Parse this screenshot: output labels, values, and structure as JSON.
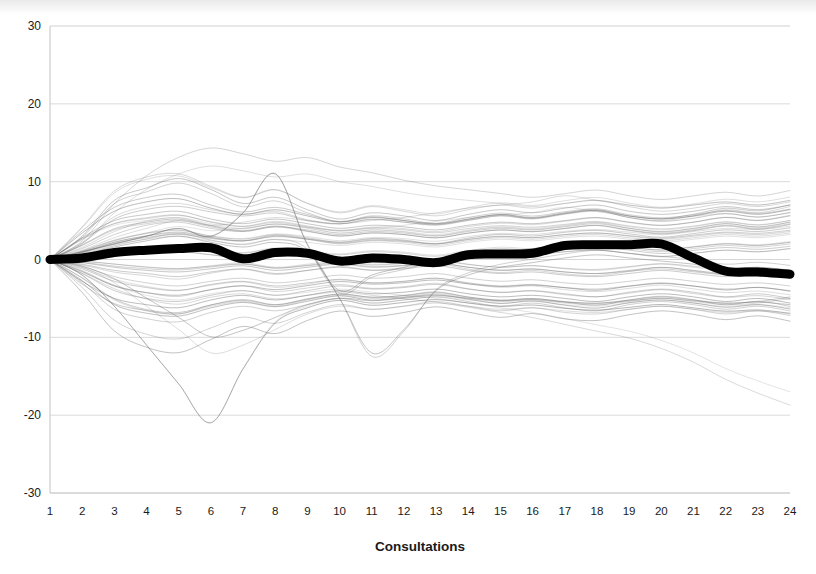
{
  "chart_data": {
    "type": "line",
    "title": "",
    "subtitle": "",
    "xlabel": "Consultations",
    "ylabel": "",
    "xlim": [
      1,
      24
    ],
    "ylim": [
      -30,
      30
    ],
    "grid": true,
    "grid_axis": "y",
    "legend": "none",
    "x": [
      1,
      2,
      3,
      4,
      5,
      6,
      7,
      8,
      9,
      10,
      11,
      12,
      13,
      14,
      15,
      16,
      17,
      18,
      19,
      20,
      21,
      22,
      23,
      24
    ],
    "y_ticks": [
      30,
      20,
      10,
      0,
      -10,
      -20,
      -30
    ],
    "y_tick_labels": [
      "30",
      "20",
      "10",
      "0",
      "-10",
      "-20",
      "-30"
    ],
    "x_tick_labels": [
      "1",
      "2",
      "3",
      "4",
      "5",
      "6",
      "7",
      "8",
      "9",
      "10",
      "11",
      "12",
      "13",
      "14",
      "15",
      "16",
      "17",
      "18",
      "19",
      "20",
      "21",
      "22",
      "23",
      "24"
    ],
    "annotations": [],
    "series": [
      {
        "name": "Mean",
        "role": "mean",
        "emphasis": "thick-black",
        "color": "#000000",
        "width": 9,
        "values": [
          0.0,
          0.2,
          0.9,
          1.2,
          1.4,
          1.5,
          0.1,
          0.9,
          0.8,
          -0.2,
          0.2,
          0.0,
          -0.4,
          0.6,
          0.7,
          0.8,
          1.8,
          1.9,
          1.9,
          2.0,
          0.2,
          -1.5,
          -1.6,
          -1.9
        ]
      },
      {
        "name": "individual-patients",
        "role": "spaghetti",
        "emphasis": "thin-gray",
        "color": "#6b6b6b",
        "width": 0.55,
        "count": 60,
        "series": [
          {
            "name": "p1",
            "values": [
              0,
              2.2,
              5.5,
              6.8,
              7.2,
              6.4,
              5.8,
              6.2,
              5.1,
              4.6,
              5.2,
              4.8,
              4.4,
              5.0,
              5.6,
              5.2,
              5.8,
              6.2,
              5.4,
              5.0,
              5.6,
              6.4,
              6.0,
              6.8
            ]
          },
          {
            "name": "p2",
            "values": [
              0,
              1.4,
              3.2,
              4.4,
              4.8,
              4.0,
              3.6,
              4.2,
              3.8,
              3.2,
              3.6,
              3.4,
              3.0,
              3.6,
              4.0,
              3.8,
              4.2,
              4.6,
              4.0,
              3.6,
              4.0,
              4.6,
              4.2,
              4.8
            ]
          },
          {
            "name": "p3",
            "values": [
              0,
              3.0,
              7.6,
              9.2,
              10.4,
              9.0,
              7.2,
              8.0,
              6.4,
              5.2,
              6.0,
              5.6,
              5.0,
              5.8,
              6.4,
              6.0,
              6.6,
              7.0,
              6.2,
              5.8,
              6.2,
              6.8,
              6.4,
              7.0
            ]
          },
          {
            "name": "p4",
            "values": [
              0,
              0.8,
              1.9,
              2.6,
              3.0,
              2.4,
              2.0,
              2.6,
              2.2,
              1.8,
              2.2,
              2.0,
              1.6,
              2.2,
              2.6,
              2.4,
              2.8,
              3.0,
              2.6,
              2.2,
              2.6,
              3.0,
              2.8,
              3.2
            ]
          },
          {
            "name": "p5",
            "values": [
              0,
              4.2,
              8.8,
              10.6,
              11.0,
              9.4,
              8.0,
              9.0,
              7.2,
              6.0,
              6.8,
              6.2,
              5.6,
              6.4,
              7.0,
              6.6,
              7.2,
              7.6,
              6.8,
              6.2,
              6.6,
              7.2,
              6.8,
              7.4
            ]
          },
          {
            "name": "p6",
            "values": [
              0,
              -1.2,
              -2.8,
              -3.6,
              -4.0,
              -3.2,
              -2.8,
              -3.4,
              -3.0,
              -2.6,
              -3.0,
              -2.8,
              -2.4,
              -3.0,
              -3.4,
              -3.2,
              -3.6,
              -3.8,
              -3.4,
              -3.0,
              -3.4,
              -3.8,
              -3.6,
              -4.0
            ]
          },
          {
            "name": "p7",
            "values": [
              0,
              -2.4,
              -5.2,
              -6.6,
              -7.0,
              -6.0,
              -5.4,
              -6.0,
              -5.2,
              -4.6,
              -5.0,
              -4.8,
              -4.4,
              -5.0,
              -5.4,
              -5.2,
              -5.6,
              -5.8,
              -5.4,
              -5.0,
              -5.4,
              -5.8,
              -5.6,
              -5.0
            ]
          },
          {
            "name": "p8",
            "values": [
              0,
              -3.6,
              -7.8,
              -9.6,
              -10.2,
              -8.8,
              -7.4,
              -8.2,
              -6.8,
              -5.8,
              -6.4,
              -6.0,
              -5.4,
              -6.0,
              -6.6,
              -6.2,
              -6.8,
              -7.0,
              -6.4,
              -6.0,
              -6.4,
              -7.0,
              -6.6,
              -7.2
            ]
          },
          {
            "name": "p9-outlier-low",
            "values": [
              0,
              -2.0,
              -6.0,
              -11.0,
              -16.0,
              -21.0,
              -14.0,
              -8.0,
              -6.0,
              -5.0,
              -5.6,
              -5.2,
              -4.8,
              -5.2,
              -5.6,
              -5.4,
              -5.8,
              -6.0,
              -5.6,
              -5.2,
              -5.6,
              -6.0,
              -5.8,
              -6.2
            ]
          },
          {
            "name": "p10-outlier-high",
            "values": [
              0,
              2.0,
              6.0,
              9.0,
              11.0,
              12.0,
              11.4,
              10.6,
              11.0,
              10.0,
              9.4,
              8.6,
              8.0,
              7.6,
              7.2,
              6.8,
              7.2,
              7.6,
              7.0,
              6.6,
              7.0,
              7.4,
              7.0,
              7.6
            ]
          },
          {
            "name": "p11",
            "values": [
              0,
              0.4,
              1.0,
              1.4,
              1.8,
              1.2,
              0.8,
              1.4,
              1.0,
              0.6,
              1.0,
              0.8,
              0.4,
              1.0,
              1.4,
              1.2,
              1.6,
              1.8,
              1.4,
              1.0,
              1.4,
              1.8,
              1.6,
              2.0
            ]
          },
          {
            "name": "p12",
            "values": [
              0,
              -0.6,
              -1.4,
              -1.8,
              -2.2,
              -1.6,
              -1.2,
              -1.8,
              -1.4,
              -1.0,
              -1.4,
              -1.2,
              -0.8,
              -1.4,
              -1.8,
              -1.6,
              -2.0,
              -2.2,
              -1.8,
              -1.4,
              -1.8,
              -2.2,
              -2.0,
              -2.4
            ]
          },
          {
            "name": "p13-spike8",
            "values": [
              0,
              1.0,
              2.0,
              3.0,
              4.0,
              3.0,
              6.0,
              11.0,
              2.0,
              -4.0,
              -2.0,
              -1.0,
              0.0,
              0.5,
              1.0,
              1.4,
              1.8,
              2.0,
              1.6,
              1.2,
              1.6,
              2.0,
              1.8,
              2.2
            ]
          },
          {
            "name": "p14-spike6",
            "values": [
              0,
              -1.0,
              -3.0,
              -6.0,
              -9.0,
              -12.0,
              -11.0,
              -9.0,
              -7.0,
              -6.0,
              -6.4,
              -6.0,
              -5.6,
              -6.0,
              -6.4,
              -6.2,
              -6.6,
              -6.8,
              -6.4,
              -6.0,
              -6.4,
              -6.8,
              -6.6,
              -7.0
            ]
          },
          {
            "name": "p15",
            "values": [
              0,
              2.6,
              4.4,
              5.0,
              5.4,
              4.6,
              4.0,
              4.6,
              4.0,
              3.4,
              3.8,
              3.6,
              3.2,
              3.8,
              4.2,
              4.0,
              4.4,
              4.8,
              4.2,
              3.8,
              4.2,
              4.8,
              4.4,
              5.0
            ]
          },
          {
            "name": "p16",
            "values": [
              0,
              -0.2,
              -0.6,
              -1.0,
              -1.2,
              -0.8,
              -0.4,
              -1.0,
              -0.6,
              -0.2,
              -0.6,
              -0.4,
              0.0,
              -0.6,
              -1.0,
              -0.8,
              -1.2,
              -1.4,
              -1.0,
              -0.6,
              -1.0,
              -1.4,
              -1.2,
              -1.6
            ]
          },
          {
            "name": "p17",
            "values": [
              0,
              1.8,
              3.8,
              4.6,
              5.0,
              4.2,
              3.6,
              4.2,
              3.6,
              3.0,
              3.4,
              3.2,
              2.8,
              3.4,
              3.8,
              3.6,
              4.0,
              4.4,
              3.8,
              3.4,
              3.8,
              4.4,
              4.0,
              4.6
            ]
          },
          {
            "name": "p18",
            "values": [
              0,
              -1.8,
              -4.0,
              -5.0,
              -5.4,
              -4.6,
              -4.0,
              -4.6,
              -4.0,
              -3.4,
              -3.8,
              -3.6,
              -3.2,
              -3.8,
              -4.2,
              -4.0,
              -4.4,
              -4.8,
              -4.2,
              -3.8,
              -4.2,
              -4.8,
              -4.4,
              -5.0
            ]
          },
          {
            "name": "p19-drop11",
            "values": [
              0,
              0.6,
              1.6,
              2.4,
              3.0,
              2.2,
              1.6,
              2.2,
              1.0,
              -5.0,
              -12.0,
              -9.0,
              -4.0,
              -2.0,
              -1.0,
              -0.4,
              0.2,
              0.6,
              0.2,
              -0.2,
              -0.6,
              -1.2,
              -1.0,
              -1.4
            ]
          },
          {
            "name": "p20-high17",
            "values": [
              0,
              1.2,
              2.8,
              4.0,
              5.0,
              4.4,
              4.8,
              5.4,
              5.0,
              4.6,
              5.0,
              5.4,
              6.0,
              6.6,
              7.0,
              7.4,
              8.2,
              7.6,
              7.0,
              6.6,
              7.0,
              7.4,
              7.0,
              7.6
            ]
          },
          {
            "name": "p21",
            "values": [
              0,
              0.2,
              0.6,
              0.8,
              1.0,
              0.6,
              0.2,
              0.8,
              0.4,
              0.0,
              0.4,
              0.2,
              -0.2,
              0.4,
              0.8,
              0.6,
              1.0,
              1.2,
              0.8,
              0.4,
              0.8,
              1.2,
              1.0,
              1.4
            ]
          },
          {
            "name": "p22",
            "values": [
              0,
              -0.4,
              -1.0,
              -1.4,
              -1.6,
              -1.2,
              -0.8,
              -1.4,
              -1.0,
              -0.6,
              -1.0,
              -0.8,
              -0.4,
              -1.0,
              -1.4,
              -1.2,
              -1.6,
              -1.8,
              -1.4,
              -1.0,
              -1.4,
              -1.8,
              -1.6,
              -2.0
            ]
          },
          {
            "name": "p23",
            "values": [
              0,
              3.4,
              6.2,
              7.4,
              7.8,
              6.6,
              5.8,
              6.4,
              5.6,
              4.8,
              5.4,
              5.0,
              4.6,
              5.2,
              5.8,
              5.4,
              6.0,
              6.4,
              5.6,
              5.2,
              5.6,
              6.2,
              5.8,
              6.4
            ]
          },
          {
            "name": "p24",
            "values": [
              0,
              -3.0,
              -6.4,
              -7.6,
              -8.0,
              -6.8,
              -6.0,
              -6.6,
              -5.8,
              -5.0,
              -5.6,
              -5.2,
              -4.8,
              -5.4,
              -6.0,
              -5.6,
              -6.2,
              -6.6,
              -5.8,
              -5.4,
              -5.8,
              -6.4,
              -6.0,
              -6.6
            ]
          },
          {
            "name": "p25-low24",
            "values": [
              0,
              -1.6,
              -3.4,
              -4.6,
              -5.2,
              -4.4,
              -4.0,
              -4.6,
              -4.2,
              -3.8,
              -4.2,
              -4.6,
              -5.0,
              -5.6,
              -6.2,
              -6.8,
              -7.6,
              -8.4,
              -9.2,
              -10.4,
              -12.0,
              -14.0,
              -15.6,
              -17.0
            ]
          },
          {
            "name": "p26",
            "values": [
              0,
              0.9,
              2.2,
              3.0,
              3.4,
              2.8,
              2.4,
              3.0,
              2.6,
              2.0,
              2.4,
              2.2,
              1.8,
              2.4,
              2.8,
              2.6,
              3.0,
              3.2,
              2.8,
              2.4,
              2.8,
              3.2,
              3.0,
              3.4
            ]
          },
          {
            "name": "p27",
            "values": [
              0,
              -0.9,
              -2.2,
              -3.0,
              -3.4,
              -2.8,
              -2.4,
              -3.0,
              -2.6,
              -2.0,
              -2.4,
              -2.2,
              -1.8,
              -2.4,
              -2.8,
              -2.6,
              -3.0,
              -3.2,
              -2.8,
              -2.4,
              -2.8,
              -3.2,
              -3.0,
              -3.4
            ]
          },
          {
            "name": "p28",
            "values": [
              0,
              2.8,
              5.0,
              5.8,
              6.2,
              5.2,
              4.6,
              5.2,
              4.6,
              4.0,
              4.4,
              4.2,
              3.8,
              4.4,
              4.8,
              4.6,
              5.0,
              5.4,
              4.8,
              4.4,
              4.8,
              5.4,
              5.0,
              5.6
            ]
          },
          {
            "name": "p29",
            "values": [
              0,
              -2.8,
              -5.0,
              -5.8,
              -6.2,
              -5.2,
              -4.6,
              -5.2,
              -4.6,
              -4.0,
              -4.4,
              -4.2,
              -3.8,
              -4.4,
              -4.8,
              -4.6,
              -5.0,
              -5.4,
              -4.8,
              -4.4,
              -4.8,
              -5.4,
              -5.0,
              -5.6
            ]
          },
          {
            "name": "p30",
            "values": [
              0,
              1.1,
              2.5,
              3.4,
              3.8,
              3.0,
              2.6,
              3.2,
              2.8,
              2.2,
              2.6,
              2.4,
              2.0,
              2.6,
              3.0,
              2.8,
              3.2,
              3.4,
              3.0,
              2.6,
              3.0,
              3.4,
              3.2,
              3.6
            ]
          }
        ]
      }
    ]
  },
  "axis": {
    "x_title": "Consultations"
  }
}
